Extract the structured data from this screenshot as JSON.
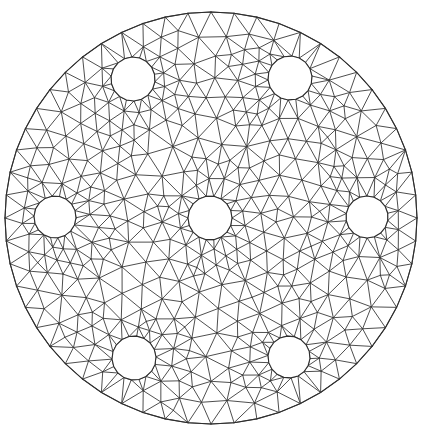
{
  "figure": {
    "name": "triangular-mesh-perforated-disk",
    "title": "",
    "caption": "",
    "width": 421,
    "height": 437,
    "background_color": "#ffffff",
    "edge_color": "#3a3a3a",
    "boundary_color": "#2e2e2e",
    "edge_width": 0.9,
    "boundary_width": 1.1,
    "hole_fill_color": "#ffffff"
  },
  "chart_data": {
    "type": "mesh",
    "title": "",
    "xlabel": "",
    "ylabel": "",
    "grid": false,
    "legend": "none",
    "domain": {
      "outer_boundary": {
        "shape": "circle",
        "cx": 211,
        "cy": 218,
        "r": 206,
        "boundary_segments": 56
      },
      "holes": [
        {
          "id": "hole-center",
          "shape": "circle",
          "cx": 210,
          "cy": 218,
          "r": 22,
          "boundary_segments": 18
        },
        {
          "id": "hole-top-left",
          "shape": "circle",
          "cx": 133,
          "cy": 79,
          "r": 22,
          "boundary_segments": 18
        },
        {
          "id": "hole-top-right",
          "shape": "circle",
          "cx": 290,
          "cy": 78,
          "r": 22,
          "boundary_segments": 18
        },
        {
          "id": "hole-left",
          "shape": "circle",
          "cx": 55,
          "cy": 217,
          "r": 21,
          "boundary_segments": 18
        },
        {
          "id": "hole-right",
          "shape": "circle",
          "cx": 367,
          "cy": 217,
          "r": 21,
          "boundary_segments": 18
        },
        {
          "id": "hole-bottom-left",
          "shape": "circle",
          "cx": 134,
          "cy": 358,
          "r": 22,
          "boundary_segments": 18
        },
        {
          "id": "hole-bottom-right",
          "shape": "circle",
          "cx": 289,
          "cy": 357,
          "r": 21,
          "boundary_segments": 18
        }
      ]
    },
    "mesh_parameters": {
      "target_edge_length": 22,
      "interior_rings_outer": 9,
      "hole_ring_count": 2,
      "hole_ring_spacing": 20,
      "jitter": 0.3,
      "relaxation_iterations": 24,
      "seed": 20240517
    },
    "counts": {
      "holes": 7,
      "approx_nodes": 430,
      "approx_triangles": 790
    }
  }
}
